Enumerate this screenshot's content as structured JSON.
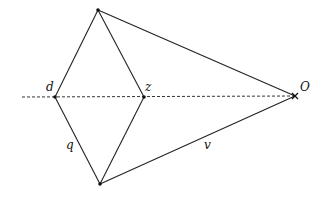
{
  "diagram": {
    "type": "geometry",
    "colors": {
      "line": "#222222",
      "background": "#ffffff"
    },
    "points": {
      "top": {
        "x": 98,
        "y": 10
      },
      "d": {
        "x": 55,
        "y": 97,
        "label": "d"
      },
      "z": {
        "x": 144,
        "y": 97,
        "label": "z"
      },
      "O": {
        "x": 295,
        "y": 96,
        "label": "O"
      },
      "bottom": {
        "x": 100,
        "y": 184
      }
    },
    "axis": {
      "x1": 22,
      "y1": 97,
      "x2": 295,
      "y2": 96,
      "style": "dashed"
    },
    "labels": {
      "d": "d",
      "z": "z",
      "O": "O",
      "q": "q",
      "v": "v"
    }
  }
}
